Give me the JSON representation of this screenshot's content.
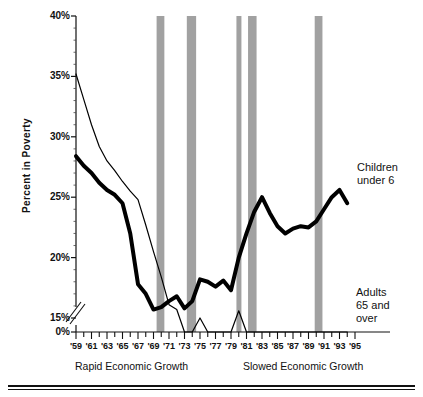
{
  "chart_data": {
    "type": "line",
    "title": "",
    "xlabel": "",
    "ylabel": "Percent in Poverty",
    "ylim": [
      0,
      40
    ],
    "xlim": [
      1959,
      1995
    ],
    "grid": false,
    "y_axis_break": true,
    "y_break_note": "axis broken between 15% and 0%",
    "yticks": [
      "0%",
      "15%",
      "20%",
      "25%",
      "30%",
      "35%",
      "40%"
    ],
    "ytick_values": [
      0,
      15,
      20,
      25,
      30,
      35,
      40
    ],
    "xticks": [
      "'59",
      "'61",
      "'63",
      "'65",
      "'67",
      "'69",
      "'71",
      "'73",
      "'75",
      "'77",
      "'79",
      "'81",
      "'83",
      "'85",
      "'87",
      "'89",
      "'91",
      "'93",
      "'95"
    ],
    "xtick_values": [
      1959,
      1961,
      1963,
      1965,
      1967,
      1969,
      1971,
      1973,
      1975,
      1977,
      1979,
      1981,
      1983,
      1985,
      1987,
      1989,
      1991,
      1993,
      1995
    ],
    "x": [
      1959,
      1960,
      1961,
      1962,
      1963,
      1964,
      1965,
      1966,
      1967,
      1968,
      1969,
      1970,
      1971,
      1972,
      1973,
      1974,
      1975,
      1976,
      1977,
      1978,
      1979,
      1980,
      1981,
      1982,
      1983,
      1984,
      1985,
      1986,
      1987,
      1988,
      1989,
      1990,
      1991,
      1992,
      1993,
      1994
    ],
    "series": [
      {
        "name": "Children under 6",
        "label": "Children\nunder 6",
        "style": "thick-black-line",
        "color": "#000000",
        "line_width": 4,
        "values": [
          28.4,
          27.6,
          27.0,
          26.2,
          25.6,
          25.2,
          24.5,
          22.0,
          17.8,
          17.0,
          15.7,
          15.9,
          16.4,
          16.8,
          15.8,
          16.4,
          18.2,
          18.0,
          17.6,
          18.1,
          17.3,
          20.0,
          22.0,
          23.8,
          25.0,
          23.7,
          22.6,
          22.0,
          22.4,
          22.6,
          22.5,
          23.0,
          24.0,
          25.0,
          25.6,
          24.5
        ]
      },
      {
        "name": "Adults 65 and over",
        "label": "Adults\n65 and\nover",
        "style": "thin-black-line",
        "color": "#000000",
        "line_width": 1.2,
        "values": [
          35.2,
          33.1,
          31.0,
          29.2,
          28.0,
          27.2,
          26.3,
          25.5,
          24.8,
          22.7,
          20.5,
          18.4,
          16.1,
          15.7,
          14.5,
          14.9,
          15.0,
          14.2,
          13.2,
          13.1,
          14.6,
          15.6,
          14.9,
          14.2,
          13.3,
          12.0,
          10.5,
          9.7,
          9.5,
          9.3,
          9.0,
          8.4,
          8.8,
          9.5,
          9.2,
          8.0
        ]
      }
    ],
    "recession_bands": [
      {
        "label": "1969-1970",
        "start": 1969.4,
        "end": 1970.4
      },
      {
        "label": "1973-1975",
        "start": 1973.3,
        "end": 1974.5
      },
      {
        "label": "1980",
        "start": 1979.7,
        "end": 1980.3
      },
      {
        "label": "1981-1982",
        "start": 1981.2,
        "end": 1982.3
      },
      {
        "label": "1990-1991",
        "start": 1989.8,
        "end": 1990.8
      }
    ],
    "band_color": "#8c8c8c",
    "annotations": [
      {
        "name": "rapid-growth-era",
        "text": "Rapid Economic Growth"
      },
      {
        "name": "slowed-growth-era",
        "text": "Slowed  Economic Growth"
      }
    ]
  },
  "labels": {
    "y_axis_title": "Percent in Poverty",
    "era_left": "Rapid Economic Growth",
    "era_right": "Slowed  Economic Growth",
    "children_line1": "Children",
    "children_line2": "under 6",
    "adults_line1": "Adults",
    "adults_line2": "65 and",
    "adults_line3": "over"
  }
}
